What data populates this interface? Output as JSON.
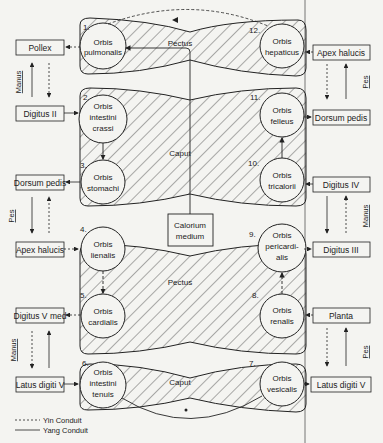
{
  "orbs": [
    {
      "num": "1.",
      "line1": "Orbis",
      "line2": "pulmonalis",
      "line3": ""
    },
    {
      "num": "2.",
      "line1": "Orbis",
      "line2": "intestini",
      "line3": "crassi"
    },
    {
      "num": "3.",
      "line1": "Orbis",
      "line2": "stomachi",
      "line3": ""
    },
    {
      "num": "4.",
      "line1": "Orbis",
      "line2": "lienalis",
      "line3": ""
    },
    {
      "num": "5.",
      "line1": "Orbis",
      "line2": "cardialis",
      "line3": ""
    },
    {
      "num": "6.",
      "line1": "Orbis",
      "line2": "intestini",
      "line3": "tenuis"
    },
    {
      "num": "7.",
      "line1": "Orbis",
      "line2": "vesicalis",
      "line3": ""
    },
    {
      "num": "8.",
      "line1": "Orbis",
      "line2": "renalis",
      "line3": ""
    },
    {
      "num": "9.",
      "line1": "Orbis",
      "line2": "pericardi-",
      "line3": "alis"
    },
    {
      "num": "10.",
      "line1": "Orbis",
      "line2": "tricalorii",
      "line3": ""
    },
    {
      "num": "11.",
      "line1": "Orbis",
      "line2": "felleus",
      "line3": ""
    },
    {
      "num": "12.",
      "line1": "Orbis",
      "line2": "hepaticus",
      "line3": ""
    }
  ],
  "left_boxes": [
    "Pollex",
    "Digitus II",
    "Dorsum pedis",
    "Apex halucis",
    "Digitus V med",
    "Latus digiti V"
  ],
  "right_boxes": [
    "Apex halucis",
    "Dorsum pedis",
    "Digitus IV",
    "Digitus III",
    "Planta",
    "Latus digiti V"
  ],
  "side_labels": {
    "left": [
      "Manus",
      "Pes",
      "Manus"
    ],
    "right": [
      "Pes",
      "Manus",
      "Pes"
    ]
  },
  "region_labels": {
    "pectus_top": "Pectus",
    "caput_upper": "Caput",
    "pectus_mid": "Pectus",
    "caput_bottom": "Caput"
  },
  "center_box": {
    "line1": "Calorium",
    "line2": "medium"
  },
  "legend": {
    "yin": "Yin Conduit",
    "yang": "Yang Conduit"
  }
}
